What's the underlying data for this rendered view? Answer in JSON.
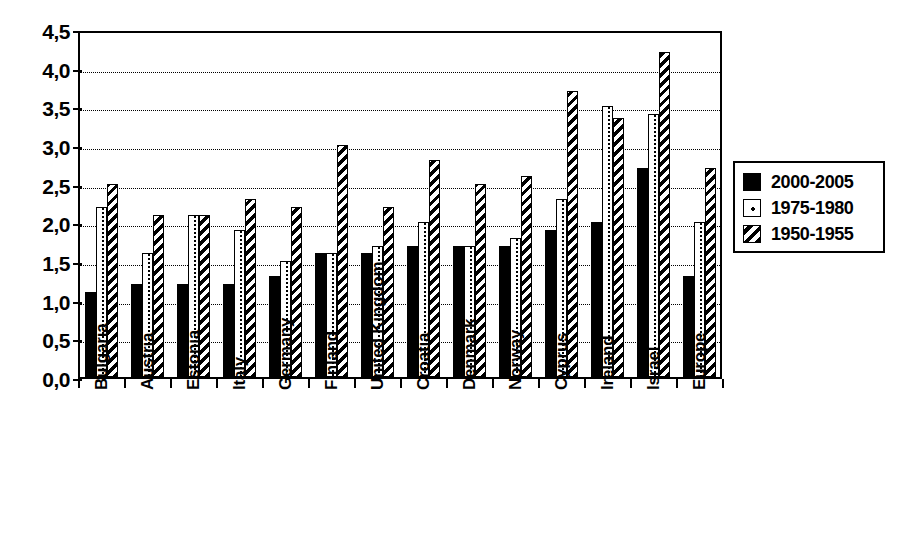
{
  "chart_data": {
    "type": "bar",
    "title": "",
    "subtitle": "",
    "xlabel": "",
    "ylabel": "",
    "ylim": [
      0.0,
      4.5
    ],
    "ytick_labels": [
      "0,0",
      "0,5",
      "1,0",
      "1,5",
      "2,0",
      "2,5",
      "3,0",
      "3,5",
      "4,0",
      "4,5"
    ],
    "ytick_values": [
      0.0,
      0.5,
      1.0,
      1.5,
      2.0,
      2.5,
      3.0,
      3.5,
      4.0,
      4.5
    ],
    "grid": "horizontal-dotted",
    "legend_position": "right",
    "decimal_separator": ",",
    "categories": [
      "Bulgaria",
      "Austria",
      "Estonia",
      "Italy",
      "Germany",
      "Finland",
      "United Kingdom",
      "Croatia",
      "Denmark",
      "Norway",
      "Cyprus",
      "Ireland",
      "Israel",
      "Europe"
    ],
    "series": [
      {
        "name": "2000-2005",
        "fill": "solid-black",
        "color": "#000000",
        "values": [
          1.1,
          1.2,
          1.2,
          1.2,
          1.3,
          1.6,
          1.6,
          1.7,
          1.7,
          1.7,
          1.9,
          2.0,
          2.7,
          1.3
        ]
      },
      {
        "name": "1975-1980",
        "fill": "white-dotted",
        "color": "#ffffff",
        "values": [
          2.2,
          1.6,
          2.1,
          1.9,
          1.5,
          1.6,
          1.7,
          2.0,
          1.7,
          1.8,
          2.3,
          3.5,
          3.4,
          2.0
        ]
      },
      {
        "name": "1950-1955",
        "fill": "diagonal-hatch",
        "color": "#ffffff",
        "values": [
          2.5,
          2.1,
          2.1,
          2.3,
          2.2,
          3.0,
          2.2,
          2.8,
          2.5,
          2.6,
          3.7,
          3.35,
          4.2,
          2.7
        ]
      }
    ]
  },
  "legend": {
    "entries": [
      {
        "label": "2000-2005",
        "swatch": "solid-black-swatch"
      },
      {
        "label": "1975-1980",
        "swatch": "white-dotted-swatch"
      },
      {
        "label": "1950-1955",
        "swatch": "diagonal-hatch-swatch"
      }
    ]
  }
}
